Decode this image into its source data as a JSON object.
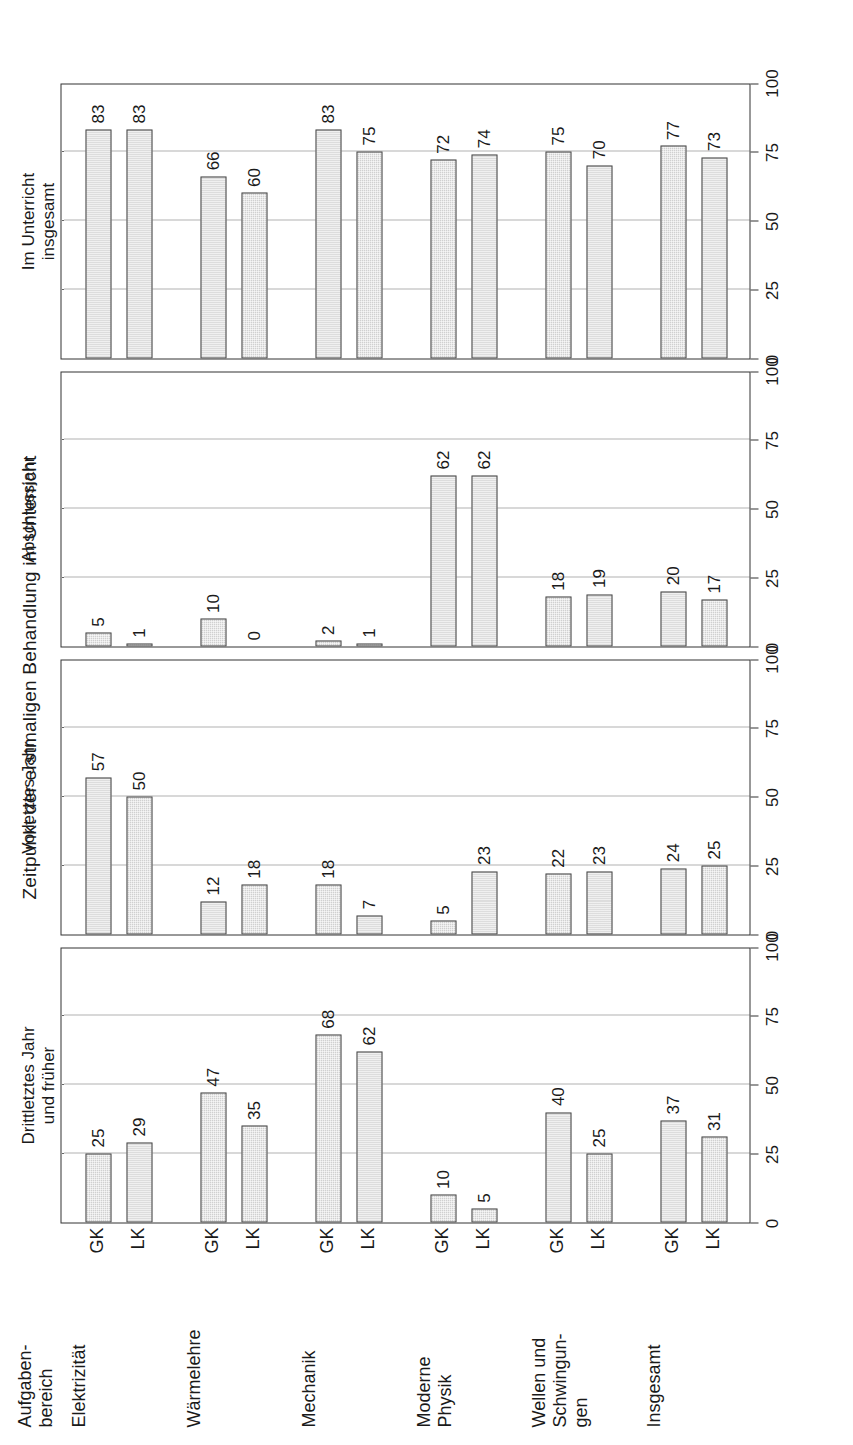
{
  "figure": {
    "suptitle": "Zeitpunkt der erstmaligen Behandlung im Unterricht",
    "row_header": "Aufgaben-\nbereich",
    "row_header_line1": "Aufgaben-",
    "row_header_line2": "bereich",
    "orientation": "rotated-90-ccw",
    "axis_ticks": [
      0,
      25,
      50,
      75,
      100
    ],
    "axis_max": 100
  },
  "chart_data": {
    "type": "bar",
    "title": "Zeitpunkt der erstmaligen Behandlung im Unterricht",
    "xlabel": "",
    "ylabel": "",
    "ylim": [
      0,
      100
    ],
    "yticks": [
      0,
      25,
      50,
      75,
      100
    ],
    "grid": true,
    "legend": "none",
    "categories": [
      "Elektrizität",
      "Wärmelehre",
      "Mechanik",
      "Moderne Physik",
      "Wellen und Schwingungen",
      "Insgesamt"
    ],
    "groups": [
      "GK",
      "LK"
    ],
    "panels": [
      {
        "title": "Drittletztes Jahr und früher",
        "title_lines": [
          "Drittletztes Jahr",
          "und früher"
        ],
        "series": [
          {
            "name": "GK",
            "values": [
              25,
              47,
              68,
              10,
              40,
              37
            ]
          },
          {
            "name": "LK",
            "values": [
              29,
              35,
              62,
              5,
              25,
              31
            ]
          }
        ]
      },
      {
        "title": "Vorletztes Jahr",
        "title_lines": [
          "Vorletztes Jahr"
        ],
        "series": [
          {
            "name": "GK",
            "values": [
              57,
              12,
              18,
              5,
              22,
              24
            ]
          },
          {
            "name": "LK",
            "values": [
              50,
              18,
              7,
              23,
              23,
              25
            ]
          }
        ]
      },
      {
        "title": "Abschlussjahr",
        "title_lines": [
          "Abschlussjahr"
        ],
        "series": [
          {
            "name": "GK",
            "values": [
              5,
              10,
              2,
              62,
              18,
              20
            ]
          },
          {
            "name": "LK",
            "values": [
              1,
              0,
              1,
              62,
              19,
              17
            ]
          }
        ]
      },
      {
        "title": "Im Unterricht insgesamt behandelt",
        "title_lines": [
          "Im Unterricht",
          "insgesamt",
          "behandelt"
        ],
        "series": [
          {
            "name": "GK",
            "values": [
              83,
              66,
              83,
              72,
              75,
              77
            ]
          },
          {
            "name": "LK",
            "values": [
              83,
              60,
              75,
              74,
              70,
              73
            ]
          }
        ]
      }
    ]
  },
  "category_label_lines": [
    [
      "Elektrizität"
    ],
    [
      "Wärmelehre"
    ],
    [
      "Mechanik"
    ],
    [
      "Moderne",
      "Physik"
    ],
    [
      "Wellen und",
      "Schwingun-",
      "gen"
    ],
    [
      "Insgesamt"
    ]
  ],
  "colors": {
    "bar_fill": "#d0d0d0",
    "bar_edge": "#4a4a4a",
    "axis": "#333333",
    "grid": "#666666",
    "text": "#1a1a1a",
    "background": "#ffffff"
  }
}
